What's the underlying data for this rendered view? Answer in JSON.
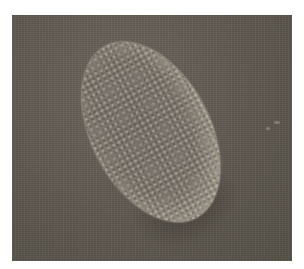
{
  "image": {
    "subject": "scanning electron micrograph of an oval textured grain",
    "colors": {
      "background": "#5e5850",
      "grain_body": "#7d776e",
      "grain_rim": "#ebe7d8",
      "page": "#ffffff"
    }
  }
}
